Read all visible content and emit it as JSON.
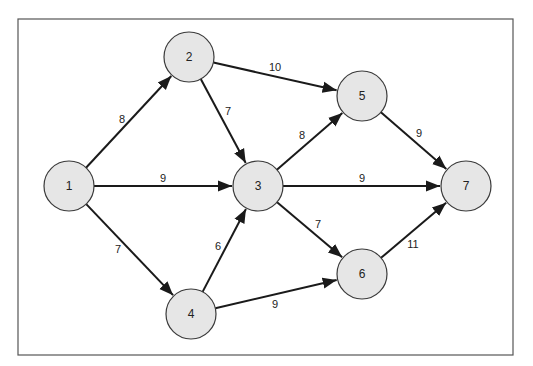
{
  "diagram": {
    "type": "weighted-directed-graph",
    "colors": {
      "node_fill": "#e6e6e6",
      "node_stroke": "#3a3a3a",
      "edge": "#1a1a1a",
      "frame": "#555555"
    },
    "nodes": [
      {
        "id": "1",
        "label": "1",
        "x": 69,
        "y": 186
      },
      {
        "id": "2",
        "label": "2",
        "x": 189,
        "y": 57
      },
      {
        "id": "3",
        "label": "3",
        "x": 258,
        "y": 186
      },
      {
        "id": "4",
        "label": "4",
        "x": 191,
        "y": 314
      },
      {
        "id": "5",
        "label": "5",
        "x": 362,
        "y": 96
      },
      {
        "id": "6",
        "label": "6",
        "x": 362,
        "y": 274
      },
      {
        "id": "7",
        "label": "7",
        "x": 466,
        "y": 186
      }
    ],
    "edges": [
      {
        "from": "1",
        "to": "2",
        "weight": "8",
        "lx": 122,
        "ly": 119
      },
      {
        "from": "1",
        "to": "3",
        "weight": "9",
        "lx": 163,
        "ly": 178
      },
      {
        "from": "1",
        "to": "4",
        "weight": "7",
        "lx": 118,
        "ly": 249
      },
      {
        "from": "2",
        "to": "3",
        "weight": "7",
        "lx": 228,
        "ly": 111
      },
      {
        "from": "2",
        "to": "5",
        "weight": "10",
        "lx": 275,
        "ly": 67
      },
      {
        "from": "4",
        "to": "3",
        "weight": "6",
        "lx": 218,
        "ly": 246
      },
      {
        "from": "3",
        "to": "5",
        "weight": "8",
        "lx": 302,
        "ly": 135
      },
      {
        "from": "3",
        "to": "7",
        "weight": "9",
        "lx": 362,
        "ly": 178
      },
      {
        "from": "3",
        "to": "6",
        "weight": "7",
        "lx": 318,
        "ly": 224
      },
      {
        "from": "4",
        "to": "6",
        "weight": "9",
        "lx": 275,
        "ly": 304
      },
      {
        "from": "5",
        "to": "7",
        "weight": "9",
        "lx": 419,
        "ly": 133
      },
      {
        "from": "6",
        "to": "7",
        "weight": "11",
        "lx": 413,
        "ly": 244
      }
    ]
  }
}
